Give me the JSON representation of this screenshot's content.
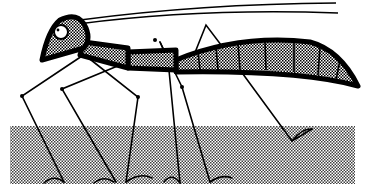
{
  "illustration": {
    "subject": "stick-legged insect",
    "colors": {
      "ink": "#000000",
      "background": "#ffffff",
      "stipple": "#8a8a8a"
    },
    "ground": {
      "x": 10,
      "y": 126,
      "width": 345,
      "height": 58
    }
  }
}
